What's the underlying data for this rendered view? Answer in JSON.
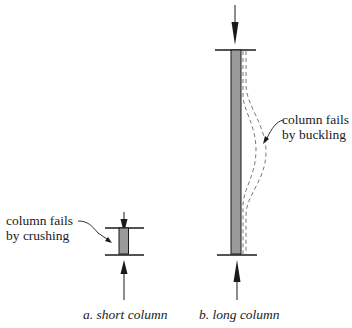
{
  "diagram": {
    "short_column": {
      "annotation_line1": "column fails",
      "annotation_line2": "by crushing",
      "caption": "a. short column"
    },
    "long_column": {
      "annotation_line1": "column fails",
      "annotation_line2": "by buckling",
      "caption": "b. long column"
    },
    "colors": {
      "column_fill": "#9a9a9a",
      "stroke": "#1a1a1a",
      "buckle_dash": "#555555"
    }
  }
}
